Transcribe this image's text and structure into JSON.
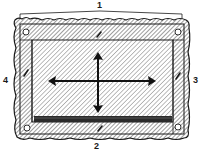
{
  "diagram": {
    "type": "technical-illustration",
    "labels": [
      {
        "id": "1",
        "text": "1",
        "position": "top"
      },
      {
        "id": "2",
        "text": "2",
        "position": "bottom"
      },
      {
        "id": "3",
        "text": "3",
        "position": "right"
      },
      {
        "id": "4",
        "text": "4",
        "position": "left"
      }
    ],
    "arrows": [
      {
        "direction": "horizontal",
        "heads": "both"
      },
      {
        "direction": "vertical",
        "heads": "both"
      }
    ],
    "corner_holes": 4,
    "colors": {
      "ink": "#1a1a1a",
      "hatch": "#555555",
      "paper": "#ffffff"
    }
  }
}
